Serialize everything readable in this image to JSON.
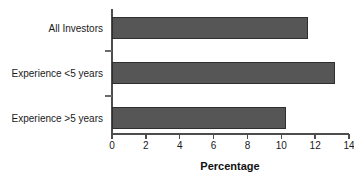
{
  "chart_data": {
    "type": "bar",
    "orientation": "horizontal",
    "title": "",
    "xlabel": "Percentage",
    "ylabel": "",
    "categories": [
      "All Investors",
      "Experience <5 years",
      "Experience >5 years"
    ],
    "values": [
      11.6,
      13.2,
      10.3
    ],
    "xlim": [
      0,
      14
    ],
    "xticks": [
      0,
      2,
      4,
      6,
      8,
      10,
      12,
      14
    ],
    "xtick_labels": [
      "0",
      "2",
      "4",
      "6",
      "8",
      "10",
      "12",
      "14"
    ],
    "grid": false,
    "legend": null,
    "bar_color": "#565656",
    "bar_edge_color": "#2f2f2f",
    "axis_color": "#4d4d4d",
    "text_color": "#1a1a1a"
  }
}
